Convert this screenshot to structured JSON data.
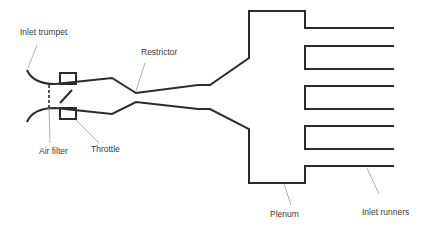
{
  "diagram": {
    "labels": {
      "inlet_trumpet": "Inlet trumpet",
      "restrictor": "Restrictor",
      "air_filter": "Air filter",
      "throttle": "Throttle",
      "plenum": "Plenum",
      "inlet_runners": "Inlet runners"
    },
    "colors": {
      "line": "#2b2b2b",
      "leader": "#9a9a9a",
      "text": "#3a3a3a"
    },
    "runner_count": 5
  }
}
